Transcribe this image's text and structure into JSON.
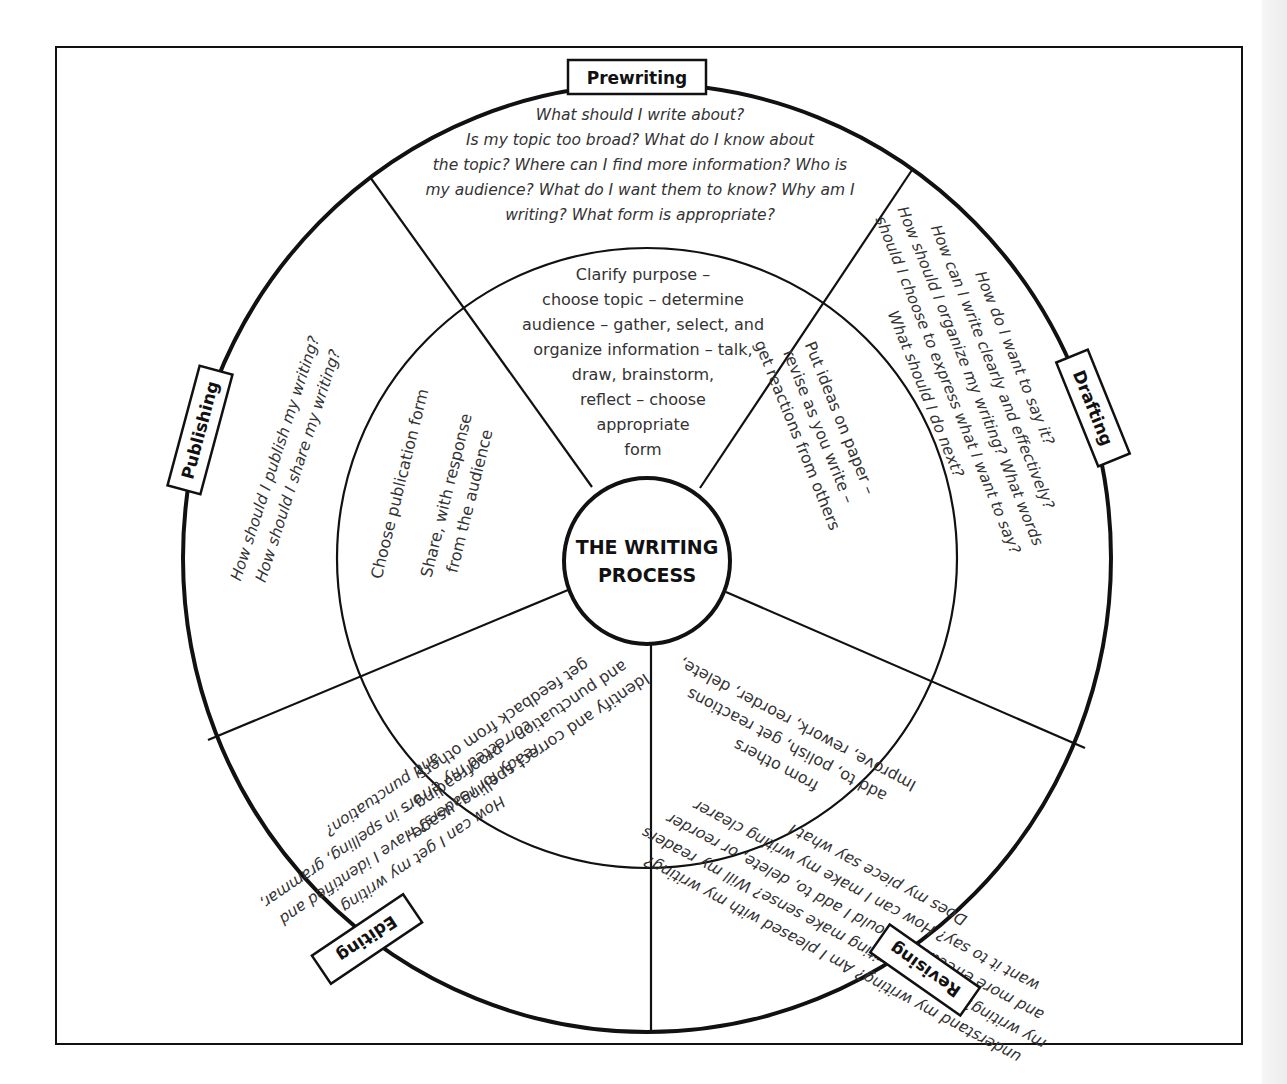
{
  "diagram": {
    "title_line1": "THE WRITING",
    "title_line2": "PROCESS",
    "stages": [
      {
        "name": "Prewriting",
        "questions": [
          "What should I write about?",
          "Is my topic too broad? What do I know about",
          "the topic? Where can I find more information? Who is",
          "my audience? What do I want them to know? Why am I",
          "writing? What form is appropriate?"
        ],
        "activities": [
          "Clarify purpose –",
          "choose topic –  determine",
          "audience – gather, select, and",
          "organize information – talk,",
          "draw, brainstorm,",
          "reflect – choose",
          "appropriate",
          "form"
        ]
      },
      {
        "name": "Drafting",
        "questions": [
          "How do I want to say it?",
          "How can I write clearly and effectively?",
          "How should I organize my writing? What words",
          "should I choose to express what I want to say?",
          "What should I  do next?"
        ],
        "activities": [
          "Put ideas on paper –",
          "revise as you write –",
          "get reactions from others"
        ]
      },
      {
        "name": "Revising",
        "questions": [
          "Does my piece say what I",
          "want it to say? How can I make my writing clearer",
          "and more effective? Should I add to, delete, or reorder",
          "my writing? Does my writing make sense? Will my readers",
          "understand my writing? Am I pleased with my writing?"
        ],
        "activities": [
          "Improve, rework, reorder, delete,",
          "add to, polish, get reactions",
          "from others"
        ]
      },
      {
        "name": "Editing",
        "questions": [
          "How can I get my writing",
          "ready for readers? Have I identified and",
          "corrected my errors in spelling, grammar,",
          "and punctuation?"
        ],
        "activities": [
          "Identify and correct spelling, usage,",
          "and punctuation – proofreading –",
          "get feedback from others"
        ]
      },
      {
        "name": "Publishing",
        "questions": [
          "How should I publish my writing?",
          "How should I share my writing?"
        ],
        "activities": [
          "Choose publication form",
          "",
          "Share, with response",
          "from the audience"
        ]
      }
    ],
    "colors": {
      "ink": "#111111",
      "text": "#333333",
      "paper": "#ffffff"
    }
  }
}
